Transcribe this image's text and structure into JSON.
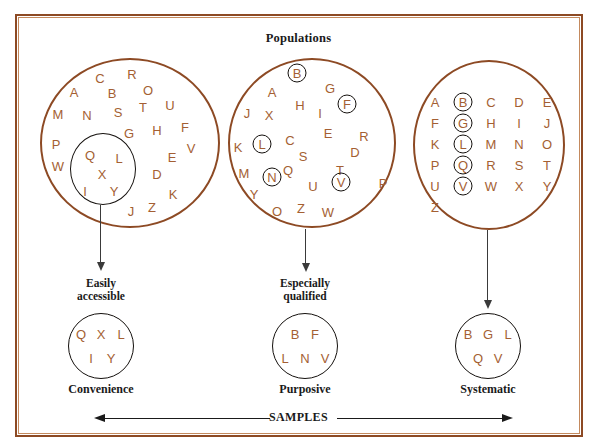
{
  "figure": {
    "top_title": "Populations",
    "bottom_axis_label": "SAMPLES",
    "frame_color": "#8d4a24",
    "letter_color": "#a45f33",
    "ring_color": "#14100d"
  },
  "columns": [
    {
      "id": "convenience",
      "stage_label": "Easily\naccessible",
      "sample_caption": "Convenience",
      "population": {
        "letters": [
          {
            "ch": "C",
            "x": 100,
            "y": 78
          },
          {
            "ch": "R",
            "x": 132,
            "y": 74
          },
          {
            "ch": "A",
            "x": 74,
            "y": 92
          },
          {
            "ch": "B",
            "x": 112,
            "y": 93
          },
          {
            "ch": "O",
            "x": 148,
            "y": 90
          },
          {
            "ch": "U",
            "x": 170,
            "y": 105
          },
          {
            "ch": "M",
            "x": 58,
            "y": 114
          },
          {
            "ch": "N",
            "x": 87,
            "y": 115
          },
          {
            "ch": "S",
            "x": 118,
            "y": 112
          },
          {
            "ch": "T",
            "x": 143,
            "y": 107
          },
          {
            "ch": "G",
            "x": 129,
            "y": 133
          },
          {
            "ch": "H",
            "x": 157,
            "y": 130
          },
          {
            "ch": "F",
            "x": 185,
            "y": 127
          },
          {
            "ch": "P",
            "x": 56,
            "y": 144
          },
          {
            "ch": "V",
            "x": 191,
            "y": 148
          },
          {
            "ch": "W",
            "x": 58,
            "y": 166
          },
          {
            "ch": "E",
            "x": 172,
            "y": 157
          },
          {
            "ch": "D",
            "x": 157,
            "y": 174
          },
          {
            "ch": "K",
            "x": 173,
            "y": 194
          },
          {
            "ch": "J",
            "x": 131,
            "y": 211
          },
          {
            "ch": "Z",
            "x": 152,
            "y": 207
          }
        ],
        "subset_letters": [
          {
            "ch": "Q",
            "x": 90,
            "y": 155
          },
          {
            "ch": "L",
            "x": 119,
            "y": 158
          },
          {
            "ch": "X",
            "x": 102,
            "y": 174
          },
          {
            "ch": "I",
            "x": 85,
            "y": 191
          },
          {
            "ch": "Y",
            "x": 114,
            "y": 191
          }
        ],
        "circled_letters": []
      },
      "sample_rows": [
        [
          "Q",
          "X",
          "L"
        ],
        [
          "I",
          "Y"
        ]
      ]
    },
    {
      "id": "purposive",
      "stage_label": "Especially\nqualified",
      "sample_caption": "Purposive",
      "population": {
        "letters": [
          {
            "ch": "A",
            "x": 272,
            "y": 92
          },
          {
            "ch": "G",
            "x": 330,
            "y": 88
          },
          {
            "ch": "H",
            "x": 300,
            "y": 105
          },
          {
            "ch": "I",
            "x": 320,
            "y": 113
          },
          {
            "ch": "J",
            "x": 247,
            "y": 113
          },
          {
            "ch": "X",
            "x": 269,
            "y": 115
          },
          {
            "ch": "E",
            "x": 328,
            "y": 133
          },
          {
            "ch": "C",
            "x": 290,
            "y": 140
          },
          {
            "ch": "R",
            "x": 364,
            "y": 136
          },
          {
            "ch": "S",
            "x": 303,
            "y": 156
          },
          {
            "ch": "D",
            "x": 355,
            "y": 152
          },
          {
            "ch": "K",
            "x": 238,
            "y": 147
          },
          {
            "ch": "Q",
            "x": 288,
            "y": 170
          },
          {
            "ch": "T",
            "x": 340,
            "y": 170
          },
          {
            "ch": "M",
            "x": 244,
            "y": 173
          },
          {
            "ch": "U",
            "x": 313,
            "y": 186
          },
          {
            "ch": "P",
            "x": 383,
            "y": 183
          },
          {
            "ch": "Y",
            "x": 254,
            "y": 194
          },
          {
            "ch": "O",
            "x": 277,
            "y": 211
          },
          {
            "ch": "Z",
            "x": 301,
            "y": 208
          },
          {
            "ch": "W",
            "x": 328,
            "y": 212
          }
        ],
        "subset_letters": [],
        "circled_letters": [
          {
            "ch": "B",
            "x": 297,
            "y": 73
          },
          {
            "ch": "F",
            "x": 347,
            "y": 104
          },
          {
            "ch": "L",
            "x": 262,
            "y": 144
          },
          {
            "ch": "N",
            "x": 272,
            "y": 177
          },
          {
            "ch": "V",
            "x": 341,
            "y": 182
          }
        ]
      },
      "sample_rows": [
        [
          "B",
          "F"
        ],
        [
          "L",
          "N",
          "V"
        ]
      ]
    },
    {
      "id": "systematic",
      "stage_label": "",
      "sample_caption": "Systematic",
      "population": {
        "grid": {
          "rows": [
            [
              "A",
              "B",
              "C",
              "D",
              "E"
            ],
            [
              "F",
              "G",
              "H",
              "I",
              "J"
            ],
            [
              "K",
              "L",
              "M",
              "N",
              "O"
            ],
            [
              "P",
              "Q",
              "R",
              "S",
              "T"
            ],
            [
              "U",
              "V",
              "W",
              "X",
              "Y"
            ],
            [
              "Z"
            ]
          ],
          "circled_column_index": 1,
          "origin_x": 435,
          "origin_y": 102,
          "col_step": 28,
          "row_step": 21
        },
        "letters": [],
        "subset_letters": [],
        "circled_letters": []
      },
      "sample_rows": [
        [
          "B",
          "G",
          "L"
        ],
        [
          "Q",
          "V"
        ]
      ]
    }
  ]
}
